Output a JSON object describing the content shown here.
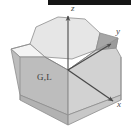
{
  "figure": {
    "background_color": "#ffffff",
    "scan_bar_color": "#151515",
    "axes": {
      "z_label": "z",
      "y_label": "y",
      "x_label": "x"
    },
    "point_labels": {
      "gamma_l": "G,L"
    },
    "solid": {
      "top_face_color": "#e2e2e2",
      "left_face_color": "#b9b9b9",
      "right_face_color": "#cfcfcf",
      "front_face_color": "#c6c6c6",
      "bevel_face_color": "#f0f0f0",
      "edge_color": "#8a8a8a",
      "dark_facet_color": "#9a9a9a"
    }
  }
}
